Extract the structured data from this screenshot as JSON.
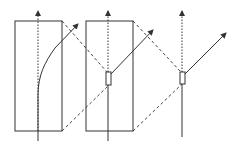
{
  "diagram": {
    "stroke_color": "#333333",
    "panels": [
      {
        "name": "thick-slab",
        "slab": {
          "x": 15,
          "y": 21,
          "w": 47,
          "h": 110
        },
        "axis_x": 38,
        "ray": "curved",
        "ray_end": [
          78,
          24
        ]
      },
      {
        "name": "slab-with-thin-element",
        "slab": {
          "x": 86,
          "y": 21,
          "w": 47,
          "h": 110
        },
        "axis_x": 108,
        "element": {
          "x": 106,
          "y": 72,
          "w": 5,
          "h": 13
        },
        "ray": "straight",
        "ray_end": [
          153,
          30
        ]
      },
      {
        "name": "thin-element-only",
        "axis_x": 182,
        "element": {
          "x": 180,
          "y": 72,
          "w": 5,
          "h": 12
        },
        "ray": "straight",
        "ray_end": [
          226,
          33
        ]
      }
    ],
    "labels": []
  }
}
